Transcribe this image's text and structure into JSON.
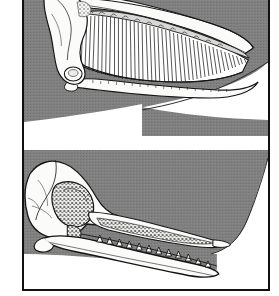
{
  "figure": {
    "frame": {
      "border_color": "#111111",
      "background": "#ffffff"
    },
    "palette": {
      "bone_white": "#fbfbfa",
      "body_gray": "#808080",
      "outline_black": "#141414",
      "shadow_gray": "#5a5a5a",
      "stipple_gray": "#6e6e6e",
      "paper_white": "#ffffff"
    },
    "panels": [
      {
        "id": "baleen-whale-skull",
        "label": "Baleen whale skull in profile",
        "order": 1,
        "subject": "mysticete",
        "feature": "baleen plates",
        "baleen_plate_count": 46,
        "parts": [
          {
            "name": "cranium",
            "label": "Cranium"
          },
          {
            "name": "rostrum",
            "label": "Upper jaw / rostrum"
          },
          {
            "name": "baleen-rack",
            "label": "Baleen plate rack"
          },
          {
            "name": "mandible",
            "label": "Lower jaw / mandible"
          },
          {
            "name": "body-silhouette",
            "label": "Whale body outline"
          }
        ]
      },
      {
        "id": "toothed-whale-skull",
        "label": "Toothed whale skull in profile",
        "order": 2,
        "subject": "odontocete",
        "feature": "conical teeth",
        "tooth_count_lower": 12,
        "tooth_count_upper": 14,
        "parts": [
          {
            "name": "cranium",
            "label": "Cranium"
          },
          {
            "name": "eye-socket",
            "label": "Orbit / temporal fossa"
          },
          {
            "name": "rostrum",
            "label": "Upper jaw / rostrum"
          },
          {
            "name": "mandible",
            "label": "Lower jaw / mandible"
          },
          {
            "name": "teeth",
            "label": "Conical teeth"
          },
          {
            "name": "body-silhouette",
            "label": "Whale body outline"
          }
        ]
      }
    ]
  }
}
